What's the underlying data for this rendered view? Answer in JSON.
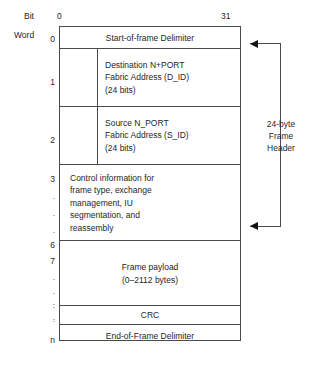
{
  "diagram": {
    "axis": {
      "bit_label": "Bit",
      "bit_start": "0",
      "bit_end": "31",
      "word_label": "Word"
    },
    "word_numbers": [
      {
        "text": "0",
        "kind": "number"
      },
      {
        "text": "1",
        "kind": "number"
      },
      {
        "text": "2",
        "kind": "number"
      },
      {
        "text": "3",
        "kind": "number"
      },
      {
        "text": ".",
        "kind": "dot"
      },
      {
        "text": ".",
        "kind": "dot"
      },
      {
        "text": ".",
        "kind": "dot"
      },
      {
        "text": "6",
        "kind": "number"
      },
      {
        "text": "7",
        "kind": "number"
      },
      {
        "text": ".",
        "kind": "dot"
      },
      {
        "text": ".",
        "kind": "dot"
      },
      {
        "text": ".",
        "kind": "dot"
      },
      {
        "text": ".",
        "kind": "dot"
      },
      {
        "text": ".",
        "kind": "dot"
      },
      {
        "text": ".",
        "kind": "dot"
      },
      {
        "text": "n",
        "kind": "number"
      }
    ],
    "rows": {
      "sof": "Start-of-frame Delimiter",
      "destination": "Destination N+PORT\nFabric Address (D_ID)\n(24 bits)",
      "source": "Source N_PORT\nFabric Address (S_ID)\n(24 bits)",
      "control": "Control information for\nframe type, exchange\nmanagement, IU\nsegmentation, and\nreassembly",
      "payload": "Frame payload\n(0–2112 bytes)",
      "crc": "CRC",
      "eof": "End-of-Frame Delimiter"
    },
    "annotation": {
      "caption": "24-byte\nFrame\nHeader"
    },
    "colors": {
      "line": "#4a4a4a",
      "text": "#262626",
      "arrow": "#111111",
      "background": "#ffffff"
    }
  }
}
